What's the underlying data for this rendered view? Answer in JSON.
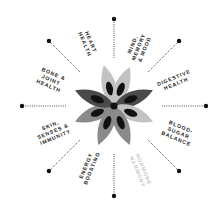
{
  "diagram": {
    "type": "radial-wheel",
    "center": {
      "x": 114,
      "y": 106
    },
    "colors": {
      "dot": "#111111",
      "label": "#1a1a1a",
      "label_faded": "#c4c4c4",
      "petal_dark": "#4a4a4a",
      "petal_mid": "#8a8a8a",
      "petal_light": "#c2c2c2",
      "petal_core": "#111111"
    },
    "labels": [
      {
        "id": "mind",
        "lines": [
          "MIND,",
          "MEMORY",
          "& MOOD"
        ],
        "faded": false
      },
      {
        "id": "digestive",
        "lines": [
          "DIGESTIVE",
          "HEALTH"
        ],
        "faded": false
      },
      {
        "id": "blood-sugar",
        "lines": [
          "BLOOD-",
          "SUGAR",
          "BALANCE"
        ],
        "faded": false
      },
      {
        "id": "hormone",
        "lines": [
          "HORMONE",
          "HARMONY"
        ],
        "faded": true
      },
      {
        "id": "energy",
        "lines": [
          "ENERGY",
          "BOOSTING"
        ],
        "faded": false
      },
      {
        "id": "skin",
        "lines": [
          "SKIN,",
          "SENSES &",
          "IMMUNITY"
        ],
        "faded": false
      },
      {
        "id": "bone",
        "lines": [
          "BONE &",
          "JOINT",
          "HEALTH"
        ],
        "faded": false
      },
      {
        "id": "heart",
        "lines": [
          "HEART",
          "HEALTH"
        ],
        "faded": false
      }
    ],
    "spokes": 8,
    "petals": 8
  }
}
